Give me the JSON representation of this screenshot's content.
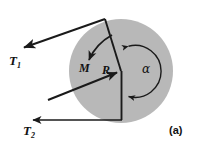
{
  "figure": {
    "part_label": "(a)",
    "background_color": "#ffffff",
    "disk_fill_color": "#b8b8b8",
    "line_color": "#1a1a1a",
    "labels": {
      "tension_1": {
        "symbol": "T",
        "subscript": "1"
      },
      "tension_2": {
        "symbol": "T",
        "subscript": "2"
      },
      "moment": "M",
      "radius": "R",
      "wrap_angle": "α"
    },
    "geometry": {
      "disk_center_x": 121,
      "disk_center_y": 71,
      "disk_radius": 52,
      "t1_tail_x": 105,
      "t1_tail_y": 19,
      "t1_head_x": 21,
      "t1_head_y": 48,
      "t2_tail_x": 122,
      "t2_tail_y": 120,
      "t2_head_x": 30,
      "t2_head_y": 120,
      "radius_tail_x": 48,
      "radius_tail_y": 100,
      "radius_head_x": 121,
      "radius_head_y": 71,
      "alpha_arc_radius": 25
    }
  }
}
